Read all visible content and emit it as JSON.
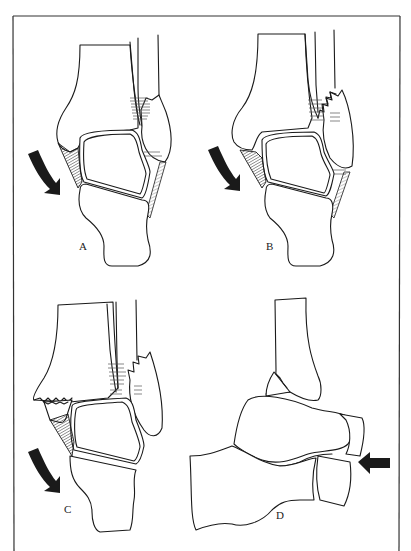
{
  "figure": {
    "border_color": "#333333",
    "panels": [
      {
        "id": "A",
        "label": "A",
        "view": "anterior ankle, tibia/fibula/talus/calcaneus",
        "arrow": "curved-down-right",
        "label_pos": [
          79,
          240
        ]
      },
      {
        "id": "B",
        "label": "B",
        "view": "anterior ankle with fibular fracture displacement",
        "arrow": "curved-down-right",
        "label_pos": [
          266,
          240
        ]
      },
      {
        "id": "C",
        "label": "C",
        "view": "anterior ankle with medial malleolus avulsion",
        "arrow": "curved-down-right",
        "label_pos": [
          64,
          503
        ]
      },
      {
        "id": "D",
        "label": "D",
        "view": "lateral foot/ankle, tarsal bones",
        "arrow": "left-pointing",
        "label_pos": [
          276,
          509
        ]
      }
    ]
  }
}
